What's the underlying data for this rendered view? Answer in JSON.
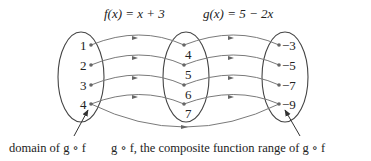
{
  "titles": {
    "f": "f(x) = x + 3",
    "g": "g(x) = 5 − 2x"
  },
  "sets": {
    "domain": [
      "1",
      "2",
      "3",
      "4"
    ],
    "middle": [
      "4",
      "5",
      "6",
      "7"
    ],
    "range": [
      "−3",
      "−5",
      "−7",
      "−9"
    ]
  },
  "captions": {
    "domain": "domain of g ∘ f",
    "composite": "g ∘ f, the composite function",
    "range": "range of g ∘ f"
  },
  "colors": {
    "line": "#7a7a7a",
    "ellipse": "#444444",
    "text": "#222222"
  }
}
